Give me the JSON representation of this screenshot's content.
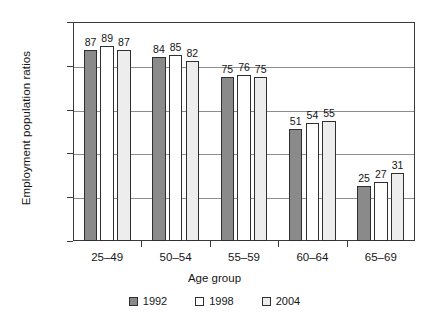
{
  "chart_data": {
    "type": "bar",
    "title": "",
    "xlabel": "Age group",
    "ylabel": "Employment population ratios",
    "categories": [
      "25–49",
      "50–54",
      "55–59",
      "60–64",
      "65–69"
    ],
    "series": [
      {
        "name": "1992",
        "color": "#8a8a8a",
        "values": [
          87,
          84,
          75,
          51,
          25
        ]
      },
      {
        "name": "1998",
        "color": "#ffffff",
        "values": [
          89,
          85,
          76,
          54,
          27
        ]
      },
      {
        "name": "2004",
        "color": "#ededed",
        "values": [
          87,
          82,
          75,
          55,
          31
        ]
      }
    ],
    "ylim": [
      0,
      100
    ],
    "yticks": [
      0,
      20,
      40,
      60,
      80,
      100
    ],
    "grid": true,
    "legend_position": "bottom",
    "legend_entries": [
      "1992",
      "1998",
      "2004"
    ]
  }
}
